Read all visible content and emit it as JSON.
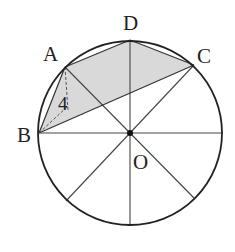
{
  "diagram": {
    "type": "geometry-circle",
    "colors": {
      "stroke": "#222222",
      "thin_stroke": "#444444",
      "shade": "#d9d9d9",
      "background": "#ffffff"
    },
    "circle": {
      "center_label": "O",
      "cx": 130,
      "cy": 133,
      "r": 92
    },
    "points": {
      "A": {
        "label": "A",
        "x": 65,
        "y": 67
      },
      "B": {
        "label": "B",
        "x": 39,
        "y": 133
      },
      "C": {
        "label": "C",
        "x": 194,
        "y": 65
      },
      "D": {
        "label": "D",
        "x": 130,
        "y": 40
      },
      "O": {
        "label": "O",
        "x": 130,
        "y": 133
      }
    },
    "shaded_region": "quadrilateral A-D-C-B (triangles ABC and ADC)",
    "length_label": "4"
  }
}
